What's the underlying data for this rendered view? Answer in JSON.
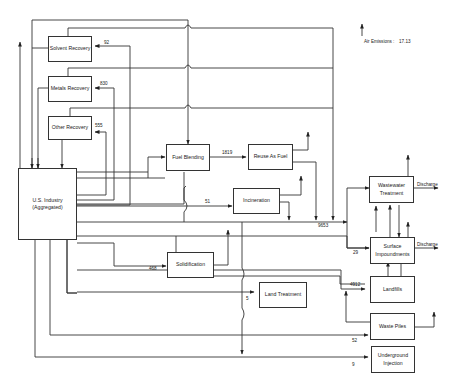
{
  "diagram": {
    "type": "waste-management flow diagram",
    "nodes": {
      "solvent_recovery": "Solvent Recovery",
      "metals_recovery": "Metals Recovery",
      "other_recovery": "Other Recovery",
      "us_industry": "U.S. Industry (Aggregated)",
      "fuel_blending": "Fuel Blending",
      "reuse_as_fuel": "Reuse As Fuel",
      "incineration": "Incineration",
      "solidification": "Solidification",
      "land_treatment": "Land Treatment",
      "wastewater_treatment": "Wastewater Treatment",
      "surface_impoundments": "Surface Impoundments",
      "landfills": "Landfills",
      "waste_piles": "Waste Piles",
      "underground_injection": "Underground Injection"
    },
    "flows": {
      "to_solvent_recovery": "92",
      "to_metals_recovery": "830",
      "to_other_recovery": "555",
      "fuel_to_reuse": "1819",
      "to_incineration": "51",
      "to_wastewater": "9653",
      "to_surface_impoundments": "29",
      "to_solidification": "468",
      "to_land_treatment": "5",
      "to_landfills": "4912",
      "to_waste_piles": "52",
      "to_underground_injection": "9"
    },
    "discharge_wastewater": "Discharge",
    "discharge_surface": "Discharge",
    "air_emissions_label": "Air Emissions :",
    "air_emissions_value": "17.13"
  }
}
